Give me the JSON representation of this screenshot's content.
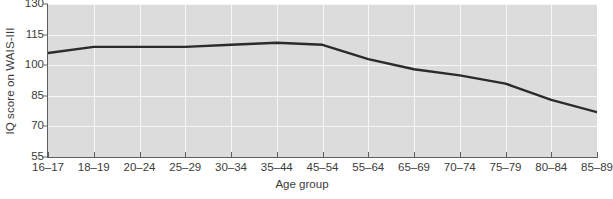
{
  "chart_data": {
    "type": "line",
    "title": "",
    "xlabel": "Age group",
    "ylabel": "IQ score on WAIS-III",
    "categories": [
      "16–17",
      "18–19",
      "20–24",
      "25–29",
      "30–34",
      "35–44",
      "45–54",
      "55–64",
      "65–69",
      "70–74",
      "75–79",
      "80–84",
      "85–89"
    ],
    "values": [
      106,
      109,
      109,
      109,
      110,
      111,
      110,
      103,
      98,
      95,
      91,
      83,
      77
    ],
    "series": [
      {
        "name": "IQ score on WAIS-III",
        "values": [
          106,
          109,
          109,
          109,
          110,
          111,
          110,
          103,
          98,
          95,
          91,
          83,
          77
        ]
      }
    ],
    "ylim": [
      55,
      130
    ],
    "yticks": [
      55,
      70,
      85,
      100,
      115,
      130
    ],
    "ytick_labels": [
      "55",
      "70",
      "85",
      "100",
      "115",
      "130"
    ],
    "grid": true,
    "legend": "none",
    "line_color": "#2b2b2b",
    "plot_background": "#dcdcdc",
    "grid_color": "#f7f7f7",
    "axis_color": "#5e5e5e",
    "figure_background": "#ffffff"
  }
}
